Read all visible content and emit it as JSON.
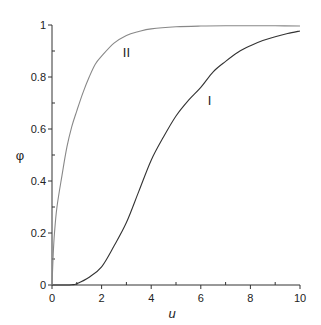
{
  "chart_data": {
    "type": "line",
    "title": "",
    "xlabel": "u",
    "ylabel": "φ",
    "xlim": [
      0,
      10
    ],
    "ylim": [
      0,
      1
    ],
    "grid": false,
    "legend": "none (curves labeled inline)",
    "x_ticks": [
      0,
      2,
      4,
      6,
      8,
      10
    ],
    "x_tick_labels": [
      "0",
      "2",
      "4",
      "6",
      "8",
      "10"
    ],
    "x_minor_ticks": [
      1,
      3,
      5,
      7,
      9
    ],
    "y_ticks": [
      0,
      0.2,
      0.4,
      0.6,
      0.8,
      1
    ],
    "y_tick_labels": [
      "0",
      "0.2",
      "0.4",
      "0.6",
      "0.8",
      "1"
    ],
    "y_minor_ticks": [
      0.1,
      0.3,
      0.5,
      0.7,
      0.9
    ],
    "series": [
      {
        "name": "I",
        "color": "#333333",
        "x": [
          0,
          0.5,
          0.8,
          1,
          1.5,
          2,
          2.5,
          3,
          3.5,
          4,
          4.5,
          5,
          5.5,
          6,
          6.5,
          7,
          7.5,
          8,
          8.5,
          9,
          9.5,
          10
        ],
        "y": [
          0,
          0,
          0.001,
          0.005,
          0.03,
          0.07,
          0.15,
          0.24,
          0.36,
          0.48,
          0.57,
          0.65,
          0.71,
          0.76,
          0.82,
          0.86,
          0.895,
          0.92,
          0.94,
          0.955,
          0.967,
          0.977
        ],
        "label_position": {
          "u": 6.35,
          "phi": 0.71
        }
      },
      {
        "name": "II",
        "color": "#888888",
        "x": [
          0,
          0.05,
          0.1,
          0.2,
          0.4,
          0.6,
          0.8,
          1,
          1.25,
          1.5,
          1.75,
          2,
          2.5,
          3,
          3.5,
          4,
          5,
          6,
          7,
          8,
          9,
          10
        ],
        "y": [
          0,
          0.12,
          0.2,
          0.3,
          0.42,
          0.53,
          0.61,
          0.67,
          0.74,
          0.8,
          0.85,
          0.88,
          0.93,
          0.96,
          0.975,
          0.985,
          0.993,
          0.996,
          0.997,
          0.997,
          0.997,
          0.996
        ],
        "label_position": {
          "u": 3.0,
          "phi": 0.895
        }
      }
    ]
  },
  "plot_area": {
    "x0": 52,
    "x1": 300,
    "y0": 285,
    "y1": 25
  },
  "colors": {
    "axis": "#333333",
    "curve_I": "#333333",
    "curve_II": "#888888"
  }
}
